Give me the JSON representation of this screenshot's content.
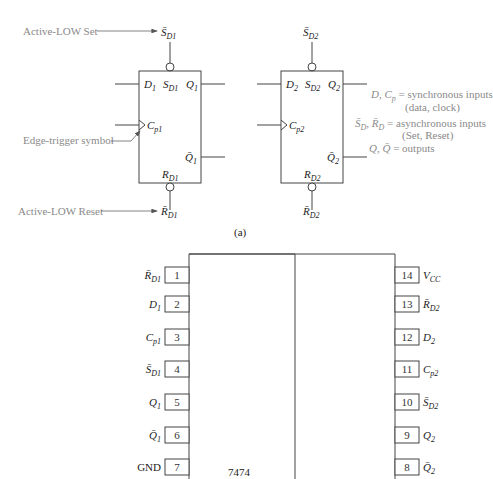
{
  "figure": {
    "caption_a": "(a)",
    "ic_label": "7474"
  },
  "annotations": {
    "active_low_set": "Active-LOW Set",
    "edge_trigger": "Edge-trigger symbol",
    "active_low_reset": "Active-LOW Reset"
  },
  "legend": {
    "line1_sym": "D, C",
    "line1_sub": "p",
    "line1_text": " = synchronous inputs",
    "line2": "(data, clock)",
    "line3_sym": "S̄",
    "line3_sub1": "D",
    "line3_mid": ", R̄",
    "line3_sub2": "D",
    "line3_text": " = asynchronous inputs",
    "line4": "(Set, Reset)",
    "line5_sym": "Q, Q̄",
    "line5_text": " = outputs"
  },
  "flipflops": [
    {
      "id": 1,
      "set_ext": {
        "main": "S̄",
        "sub": "D1"
      },
      "set_int": {
        "main": "S",
        "sub": "D1"
      },
      "d": {
        "main": "D",
        "sub": "1"
      },
      "q": {
        "main": "Q",
        "sub": "1"
      },
      "cp": {
        "main": "C",
        "sub": "p1"
      },
      "qbar": {
        "main": "Q̄",
        "sub": "1"
      },
      "reset_int": {
        "main": "R",
        "sub": "D1"
      },
      "reset_ext": {
        "main": "R̄",
        "sub": "D1"
      }
    },
    {
      "id": 2,
      "set_ext": {
        "main": "S̄",
        "sub": "D2"
      },
      "set_int": {
        "main": "S",
        "sub": "D2"
      },
      "d": {
        "main": "D",
        "sub": "2"
      },
      "q": {
        "main": "Q",
        "sub": "2"
      },
      "cp": {
        "main": "C",
        "sub": "p2"
      },
      "qbar": {
        "main": "Q̄",
        "sub": "2"
      },
      "reset_int": {
        "main": "R",
        "sub": "D2"
      },
      "reset_ext": {
        "main": "R̄",
        "sub": "D2"
      }
    }
  ],
  "ic_pins": {
    "left": [
      {
        "num": "1",
        "main": "R̄",
        "sub": "D1"
      },
      {
        "num": "2",
        "main": "D",
        "sub": "1"
      },
      {
        "num": "3",
        "main": "C",
        "sub": "p1"
      },
      {
        "num": "4",
        "main": "S̄",
        "sub": "D1"
      },
      {
        "num": "5",
        "main": "Q",
        "sub": "1"
      },
      {
        "num": "6",
        "main": "Q̄",
        "sub": "1"
      },
      {
        "num": "7",
        "main": "GND",
        "sub": ""
      }
    ],
    "right": [
      {
        "num": "14",
        "main": "V",
        "sub": "CC"
      },
      {
        "num": "13",
        "main": "R̄",
        "sub": "D2"
      },
      {
        "num": "12",
        "main": "D",
        "sub": "2"
      },
      {
        "num": "11",
        "main": "C",
        "sub": "p2"
      },
      {
        "num": "10",
        "main": "S̄",
        "sub": "D2"
      },
      {
        "num": "9",
        "main": "Q",
        "sub": "2"
      },
      {
        "num": "8",
        "main": "Q̄",
        "sub": "2"
      }
    ]
  }
}
